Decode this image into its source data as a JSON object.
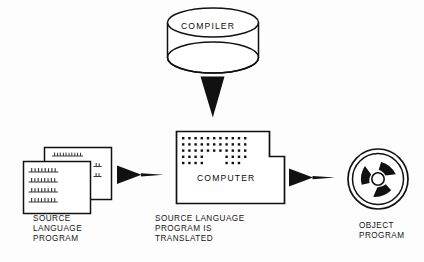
{
  "diagram": {
    "background_color": "#fdfdfd",
    "ink_color": "#111111",
    "nodes": {
      "compiler": {
        "label": "COMPILER",
        "shape": "cylinder",
        "icon_name": "disk-pack-cylinder-icon"
      },
      "source_program": {
        "label": "SOURCE\nLANGUAGE\nPROGRAM",
        "shape": "stacked-sheets",
        "icon_name": "document-stack-icon",
        "sheet_count": 2
      },
      "computer": {
        "label": "COMPUTER",
        "shape": "l-shaped-box",
        "icon_name": "computer-console-icon",
        "caption": "SOURCE LANGUAGE\nPROGRAM IS\nTRANSLATED",
        "dot_grid": {
          "columns": 11,
          "rows": 5
        }
      },
      "object_program": {
        "label": "OBJECT\nPROGRAM",
        "shape": "tape-reel",
        "icon_name": "tape-reel-icon",
        "spokes": 3
      }
    },
    "arrows": [
      {
        "name": "arrow-compiler-to-computer",
        "direction": "down",
        "icon_name": "arrow-down-icon"
      },
      {
        "name": "arrow-source-to-computer",
        "direction": "right",
        "icon_name": "arrow-right-icon"
      },
      {
        "name": "arrow-computer-to-object",
        "direction": "right",
        "icon_name": "arrow-right-icon"
      }
    ]
  }
}
